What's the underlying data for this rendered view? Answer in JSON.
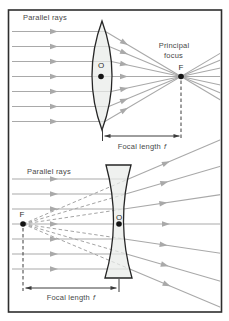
{
  "figure": {
    "type": "lens-ray-diagram",
    "width": 229,
    "height": 321
  },
  "colors": {
    "background": "#ffffff",
    "frame": "#2e2e2e",
    "ray": "#a9a9a9",
    "virtual_ray": "#a4a4a4",
    "lens_fill": "#e9ece9",
    "lens_stroke": "#262626",
    "annotation": "#3c3c3c",
    "label": "#484848",
    "point": "#141414"
  },
  "top_diagram": {
    "labels": {
      "parallel_rays": "Parallel rays",
      "principal_focus_line1": "Principal",
      "principal_focus_line2": "focus",
      "focus_point": "F",
      "optical_centre": "O",
      "focal_length": "Focal length",
      "focal_length_symbol": "f"
    },
    "geometry": {
      "ray_ys": [
        31.5,
        46.5,
        61.5,
        76.5,
        91.5,
        106.5,
        121.5
      ],
      "axis_y": 76.5,
      "ray_start_x": 12,
      "clip_x": 220.5,
      "in_arrow_x": 58,
      "out_arrow_x": 128,
      "lens": {
        "cx": 102,
        "cy": 75.5,
        "half_height": 54.5,
        "max_half_width": 10
      },
      "focus": {
        "x": 181,
        "y": 76.5
      },
      "centre_dot": {
        "x": 101,
        "y": 76.5
      },
      "dashed_drop": {
        "x": 181,
        "y1": 80.5,
        "y2": 139
      },
      "lens_tick": {
        "x": 102.5,
        "y1": 127.5,
        "y2": 141
      },
      "dim_arrow": {
        "x1": 104.5,
        "x2": 179.5,
        "y": 136
      }
    }
  },
  "bottom_diagram": {
    "labels": {
      "parallel_rays": "Parallel rays",
      "focus_point": "F",
      "optical_centre": "O",
      "focal_length": "Focal length",
      "focal_length_symbol": "f"
    },
    "geometry": {
      "ray_ys": [
        179,
        194,
        209,
        224,
        239,
        254,
        269
      ],
      "axis_y": 224,
      "ray_start_x": 12,
      "clip_x": 220.5,
      "in_arrow_x": 58,
      "out_arrow_frac": 0.45,
      "axis_arrow_x": 170,
      "lens": {
        "cx": 118.5,
        "top_y": 165,
        "bottom_y": 278,
        "mid_y": 221.5,
        "half_top": 12.5,
        "half_bottom": 13.5,
        "half_waist": 5,
        "curve_k": 8.8
      },
      "focus": {
        "x": 23,
        "y": 224
      },
      "centre_dot": {
        "x": 119,
        "y": 224
      },
      "dashed_drop": {
        "x": 23,
        "y1": 228,
        "y2": 291
      },
      "lens_tick": {
        "x": 119,
        "y1": 279,
        "y2": 292
      },
      "dim_arrow": {
        "x1": 25.5,
        "x2": 116.5,
        "y": 288
      }
    }
  }
}
